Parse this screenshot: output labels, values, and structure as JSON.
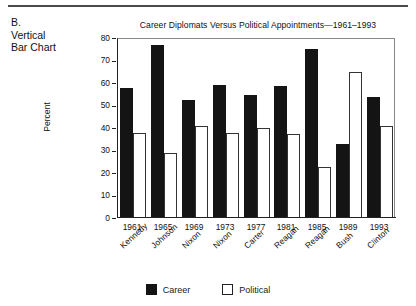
{
  "figure": {
    "label_lines": [
      "B.",
      "Vertical",
      "Bar Chart"
    ]
  },
  "legend": {
    "career_label": "Career",
    "political_label": "Political"
  },
  "colors": {
    "career": "#141414",
    "political": "#ffffff",
    "political_border": "#333333",
    "axis": "#222222"
  },
  "chart_data": {
    "type": "bar",
    "title": "Career Diplomats Versus Political Appointments—1961–1993",
    "xlabel": "",
    "ylabel": "Percent",
    "ylim": [
      0,
      80
    ],
    "yticks": [
      0,
      10,
      20,
      30,
      40,
      50,
      60,
      70,
      80
    ],
    "ytick_labels": [
      "0",
      "10",
      "20",
      "30",
      "40",
      "50",
      "60",
      "70",
      "80"
    ],
    "grid": false,
    "legend_position": "bottom-center",
    "categories": [
      "1961",
      "1965",
      "1969",
      "1973",
      "1977",
      "1981",
      "1985",
      "1989",
      "1993"
    ],
    "category_sublabels": [
      "Kennedy",
      "Johnson",
      "Nixon",
      "Nixon",
      "Carter",
      "Reagan",
      "Reagan",
      "Bush",
      "Clinton"
    ],
    "series": [
      {
        "name": "Career",
        "values": [
          58,
          77,
          52.5,
          59,
          54.5,
          58.5,
          75,
          33,
          54
        ]
      },
      {
        "name": "Political",
        "values": [
          38,
          29,
          41,
          38,
          40,
          37.5,
          22.5,
          65,
          41
        ]
      }
    ]
  }
}
